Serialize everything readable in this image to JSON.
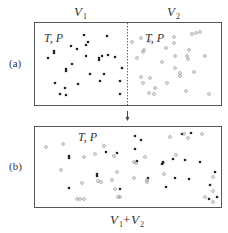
{
  "labels": {
    "v1": "V",
    "v1_sub": "1",
    "v2": "V",
    "v2_sub": "2",
    "panel_a": "(a)",
    "panel_b": "(b)",
    "tp_a_left": "T, P",
    "tp_a_right": "T, P",
    "tp_b": "T, P",
    "sum_v1": "V",
    "sum_v1_sub": "1",
    "sum_plus": "+",
    "sum_v2": "V",
    "sum_v2_sub": "2"
  },
  "colors": {
    "border": "#555555",
    "filled_particle": "#222222",
    "open_particle": "#777777",
    "divider": "#666666"
  },
  "panel_a": {
    "filled": [
      [
        84,
        35
      ],
      [
        88,
        42
      ],
      [
        86,
        45
      ],
      [
        107,
        36
      ],
      [
        71,
        46
      ],
      [
        77,
        49
      ],
      [
        54,
        51
      ],
      [
        54,
        53
      ],
      [
        48,
        58
      ],
      [
        86,
        56
      ],
      [
        102,
        56
      ],
      [
        99,
        58
      ],
      [
        99,
        60
      ],
      [
        108,
        55
      ],
      [
        115,
        57
      ],
      [
        72,
        64
      ],
      [
        66,
        69
      ],
      [
        66,
        71
      ],
      [
        122,
        68
      ],
      [
        90,
        74
      ],
      [
        104,
        74
      ],
      [
        55,
        83
      ],
      [
        100,
        81
      ],
      [
        78,
        84
      ],
      [
        120,
        81
      ],
      [
        65,
        88
      ],
      [
        60,
        94
      ],
      [
        66,
        95
      ],
      [
        120,
        94
      ]
    ],
    "open": [
      [
        132,
        42
      ],
      [
        141,
        38
      ],
      [
        149,
        41
      ],
      [
        174,
        37
      ],
      [
        192,
        34
      ],
      [
        196,
        33
      ],
      [
        200,
        32
      ],
      [
        174,
        43
      ],
      [
        144,
        50
      ],
      [
        143,
        52
      ],
      [
        166,
        48
      ],
      [
        189,
        50
      ],
      [
        137,
        58
      ],
      [
        175,
        56
      ],
      [
        187,
        56
      ],
      [
        188,
        59
      ],
      [
        205,
        56
      ],
      [
        162,
        62
      ],
      [
        175,
        68
      ],
      [
        180,
        73
      ],
      [
        180,
        76
      ],
      [
        194,
        72
      ],
      [
        141,
        77
      ],
      [
        150,
        78
      ],
      [
        143,
        83
      ],
      [
        167,
        83
      ],
      [
        155,
        88
      ],
      [
        149,
        93
      ],
      [
        154,
        94
      ],
      [
        186,
        91
      ],
      [
        209,
        94
      ]
    ]
  },
  "panel_b": {
    "filled": [
      [
        141,
        140
      ],
      [
        135,
        136
      ],
      [
        191,
        133
      ],
      [
        69,
        156
      ],
      [
        69,
        158
      ],
      [
        106,
        152
      ],
      [
        117,
        153
      ],
      [
        135,
        149
      ],
      [
        137,
        161
      ],
      [
        163,
        162
      ],
      [
        162,
        164
      ],
      [
        163,
        163
      ],
      [
        173,
        159
      ],
      [
        185,
        160
      ],
      [
        200,
        162
      ],
      [
        215,
        172
      ],
      [
        97,
        174
      ],
      [
        97,
        176
      ],
      [
        148,
        178
      ],
      [
        175,
        178
      ],
      [
        189,
        179
      ],
      [
        69,
        188
      ],
      [
        120,
        189
      ],
      [
        166,
        187
      ],
      [
        210,
        185
      ],
      [
        182,
        134
      ],
      [
        217,
        197
      ],
      [
        209,
        199
      ]
    ],
    "open": [
      [
        46,
        147
      ],
      [
        63,
        144
      ],
      [
        104,
        146
      ],
      [
        170,
        137
      ],
      [
        184,
        134
      ],
      [
        188,
        138
      ],
      [
        202,
        134
      ],
      [
        95,
        154
      ],
      [
        84,
        157
      ],
      [
        114,
        156
      ],
      [
        145,
        157
      ],
      [
        136,
        163
      ],
      [
        176,
        155
      ],
      [
        134,
        162
      ],
      [
        61,
        170
      ],
      [
        117,
        172
      ],
      [
        164,
        174
      ],
      [
        213,
        177
      ],
      [
        147,
        180
      ],
      [
        98,
        181
      ],
      [
        101,
        182
      ],
      [
        112,
        180
      ],
      [
        82,
        183
      ],
      [
        134,
        178
      ],
      [
        147,
        182
      ],
      [
        115,
        189
      ],
      [
        120,
        197
      ],
      [
        80,
        199
      ],
      [
        77,
        199
      ],
      [
        84,
        199
      ],
      [
        118,
        197
      ],
      [
        213,
        191
      ],
      [
        205,
        197
      ],
      [
        213,
        202
      ]
    ]
  }
}
